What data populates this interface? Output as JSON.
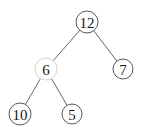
{
  "diagram": {
    "type": "binary-tree",
    "nodes": [
      {
        "id": "n12",
        "label": "12",
        "highlighted": false
      },
      {
        "id": "n6",
        "label": "6",
        "highlighted": true
      },
      {
        "id": "n7",
        "label": "7",
        "highlighted": false
      },
      {
        "id": "n10",
        "label": "10",
        "highlighted": false
      },
      {
        "id": "n5",
        "label": "5",
        "highlighted": false
      }
    ],
    "edges": [
      {
        "from": "n12",
        "to": "n6"
      },
      {
        "from": "n12",
        "to": "n7"
      },
      {
        "from": "n6",
        "to": "n10"
      },
      {
        "from": "n6",
        "to": "n5"
      }
    ]
  }
}
